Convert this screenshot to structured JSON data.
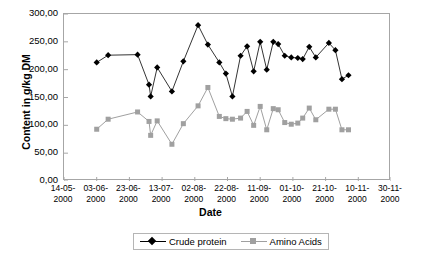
{
  "chart_data": {
    "type": "line",
    "title": "",
    "xlabel": "Date",
    "ylabel": "Content in g/kg DM",
    "ylim": [
      0,
      300
    ],
    "ytick_labels": [
      "300,00",
      "250,00",
      "200,00",
      "150,00",
      "100,00",
      "50,00",
      "0,00"
    ],
    "ytick_values": [
      300,
      250,
      200,
      150,
      100,
      50,
      0
    ],
    "xtick_labels": [
      [
        "14-05-",
        "2000"
      ],
      [
        "03-06-",
        "2000"
      ],
      [
        "23-06-",
        "2000"
      ],
      [
        "13-07-",
        "2000"
      ],
      [
        "02-08-",
        "2000"
      ],
      [
        "22-08-",
        "2000"
      ],
      [
        "11-09-",
        "2000"
      ],
      [
        "01-10-",
        "2000"
      ],
      [
        "21-10-",
        "2000"
      ],
      [
        "10-11-",
        "2000"
      ],
      [
        "30-11-",
        "2000"
      ]
    ],
    "xlim_days": [
      0,
      200
    ],
    "grid": false,
    "legend_position": "bottom",
    "x_days": [
      20,
      27,
      45,
      52,
      53,
      57,
      66,
      73,
      82,
      88,
      95,
      99,
      103,
      108,
      112,
      116,
      120,
      124,
      128,
      131,
      135,
      139,
      143,
      146,
      150,
      154,
      162,
      166,
      170,
      174
    ],
    "series": [
      {
        "name": "Crude protein",
        "color": "#000000",
        "marker": "diamond",
        "values": [
          213,
          226,
          227,
          173,
          152,
          204,
          161,
          215,
          280,
          245,
          213,
          193,
          152,
          225,
          242,
          197,
          250,
          200,
          250,
          246,
          225,
          222,
          221,
          219,
          241,
          222,
          248,
          235,
          183,
          190
        ]
      },
      {
        "name": "Amino Acids",
        "color": "#a0a0a0",
        "marker": "square",
        "values": [
          93,
          111,
          124,
          107,
          82,
          108,
          66,
          103,
          135,
          168,
          116,
          112,
          111,
          113,
          125,
          100,
          134,
          92,
          130,
          128,
          105,
          102,
          104,
          113,
          131,
          110,
          129,
          129,
          92,
          92
        ]
      }
    ]
  }
}
